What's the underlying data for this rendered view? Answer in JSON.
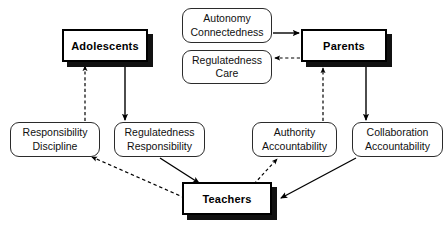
{
  "diagram": {
    "background_color": "#ffffff",
    "line_color": "#000000",
    "nodes": {
      "adolescents": {
        "label": "Adolescents",
        "x": 62,
        "y": 29,
        "w": 86,
        "h": 33,
        "kind": "primary"
      },
      "parents": {
        "label": "Parents",
        "x": 301,
        "y": 29,
        "w": 86,
        "h": 33,
        "kind": "primary"
      },
      "teachers": {
        "label": "Teachers",
        "x": 182,
        "y": 182,
        "w": 90,
        "h": 33,
        "kind": "primary"
      },
      "autonomy_connectedness": {
        "label": "Autonomy\nConnectedness",
        "x": 182,
        "y": 8,
        "w": 90,
        "h": 35,
        "kind": "attr"
      },
      "regulatedness_care": {
        "label": "Regulatedness\nCare",
        "x": 182,
        "y": 50,
        "w": 90,
        "h": 34,
        "kind": "attr"
      },
      "responsibility_discipline": {
        "label": "Responsibility\nDiscipline",
        "x": 10,
        "y": 122,
        "w": 90,
        "h": 35,
        "kind": "attr"
      },
      "regulatedness_responsibility": {
        "label": "Regulatedness\nResponsibility",
        "x": 114,
        "y": 122,
        "w": 91,
        "h": 35,
        "kind": "attr"
      },
      "authority_accountability": {
        "label": "Authority\nAccountability",
        "x": 252,
        "y": 122,
        "w": 85,
        "h": 35,
        "kind": "attr"
      },
      "collaboration_accountability": {
        "label": "Collaboration\nAccountability",
        "x": 352,
        "y": 122,
        "w": 91,
        "h": 35,
        "kind": "attr"
      }
    },
    "edges": [
      {
        "name": "autonomy-to-parents",
        "from": "autonomy_connectedness",
        "to": "parents",
        "style": "solid"
      },
      {
        "name": "parents-to-regulatedness-care",
        "from": "parents",
        "to": "regulatedness_care",
        "style": "dashed"
      },
      {
        "name": "responsibility-discipline-to-adolescents",
        "from": "responsibility_discipline",
        "to": "adolescents",
        "style": "dashed"
      },
      {
        "name": "adolescents-to-regulatedness-responsibility",
        "from": "adolescents",
        "to": "regulatedness_responsibility",
        "style": "solid"
      },
      {
        "name": "authority-accountability-to-parents",
        "from": "authority_accountability",
        "to": "parents",
        "style": "dashed"
      },
      {
        "name": "parents-to-collaboration-accountability",
        "from": "parents",
        "to": "collaboration_accountability",
        "style": "solid"
      },
      {
        "name": "regulatedness-responsibility-to-teachers",
        "from": "regulatedness_responsibility",
        "to": "teachers",
        "style": "solid"
      },
      {
        "name": "teachers-to-responsibility-discipline",
        "from": "teachers",
        "to": "responsibility_discipline",
        "style": "dashed"
      },
      {
        "name": "teachers-to-authority-accountability",
        "from": "teachers",
        "to": "authority_accountability",
        "style": "dashed"
      },
      {
        "name": "collaboration-accountability-to-teachers",
        "from": "collaboration_accountability",
        "to": "teachers",
        "style": "solid"
      }
    ]
  }
}
